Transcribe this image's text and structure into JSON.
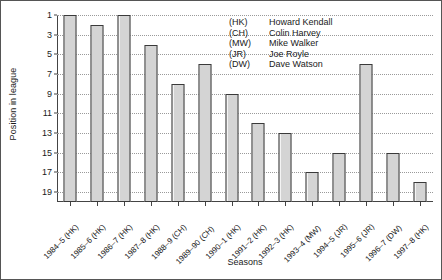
{
  "chart_data": {
    "type": "bar",
    "title": "",
    "xlabel": "Seasons",
    "ylabel": "Position in league",
    "categories": [
      "1984–5 (HK)",
      "1985–6 (HK)",
      "1986–7 (HK)",
      "1987–8 (HK)",
      "1988–9 (CH)",
      "1989–90 (CH)",
      "1990–1 (HK)",
      "1991–2 (HK)",
      "1992–3 (HK)",
      "1993–4 (MW)",
      "1994–5 (JR)",
      "1995–6 (JR)",
      "1996–7 (DW)",
      "1997–8 (HK)"
    ],
    "values": [
      1,
      2,
      1,
      4,
      8,
      6,
      9,
      12,
      13,
      17,
      15,
      6,
      15,
      18
    ],
    "ylim": [
      1,
      20
    ],
    "y_inverted": true,
    "yticks": [
      1,
      3,
      5,
      7,
      9,
      11,
      13,
      15,
      17,
      19
    ],
    "ytick_labels": [
      "1",
      "3",
      "5",
      "7",
      "9",
      "11",
      "13",
      "15",
      "17",
      "19"
    ],
    "grid": true,
    "grid_axis": "y",
    "legend_position": "upper-right",
    "bar_fill_color": "#d4d4d4",
    "bar_edge_color": "#3a3a3a",
    "axis_color": "#444444",
    "grid_color": "#9a9a9a"
  },
  "legend": {
    "entries": [
      {
        "code": "(HK)",
        "name": "Howard Kendall"
      },
      {
        "code": "(CH)",
        "name": "Colin Harvey"
      },
      {
        "code": "(MW)",
        "name": "Mike Walker"
      },
      {
        "code": "(JR)",
        "name": "Joe Royle"
      },
      {
        "code": "(DW)",
        "name": "Dave Watson"
      }
    ]
  }
}
